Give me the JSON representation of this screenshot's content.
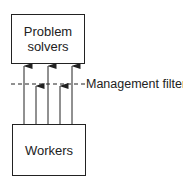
{
  "diagram": {
    "top_box": {
      "line1": "Problem",
      "line2": "solvers"
    },
    "bottom_box": {
      "label": "Workers"
    },
    "filter_label": "Management filter",
    "arrows": {
      "passing_through": 3,
      "blocked_at_filter": 2
    },
    "colors": {
      "stroke": "#222222",
      "background": "#ffffff"
    }
  }
}
